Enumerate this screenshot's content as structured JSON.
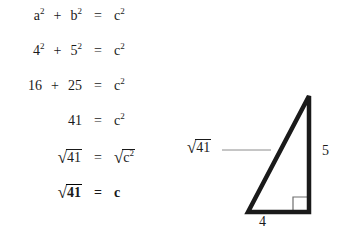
{
  "equations": {
    "rows": [
      {
        "lhs_a": "a",
        "lhs_a_sup": "2",
        "operator": "+",
        "lhs_b": "b",
        "lhs_b_sup": "2",
        "equals": "=",
        "rhs": "c",
        "rhs_sup": "2",
        "bold": false
      },
      {
        "lhs_a": "4",
        "lhs_a_sup": "2",
        "operator": "+",
        "lhs_b": "5",
        "lhs_b_sup": "2",
        "equals": "=",
        "rhs": "c",
        "rhs_sup": "2",
        "bold": false
      },
      {
        "lhs_a": "16",
        "lhs_a_sup": "",
        "operator": "+",
        "lhs_b": "25",
        "lhs_b_sup": "",
        "equals": "=",
        "rhs": "c",
        "rhs_sup": "2",
        "bold": false
      },
      {
        "lhs_a": "",
        "lhs_a_sup": "",
        "operator": "",
        "lhs_b": "41",
        "lhs_b_sup": "",
        "equals": "=",
        "rhs": "c",
        "rhs_sup": "2",
        "bold": false
      },
      {
        "lhs_a": "",
        "lhs_a_sup": "",
        "operator": "",
        "lhs_b_radicand": "41",
        "equals": "=",
        "rhs_radicand": "c",
        "rhs_radicand_sup": "2",
        "bold": false
      },
      {
        "lhs_a": "",
        "lhs_a_sup": "",
        "operator": "",
        "lhs_b_radicand": "41",
        "equals": "=",
        "rhs": "c",
        "rhs_sup": "",
        "bold": true
      }
    ],
    "radical_sign": "√"
  },
  "diagram": {
    "hypotenuse_label_radicand": "41",
    "hypotenuse_radical_sign": "√",
    "vertical_leg_label": "5",
    "horizontal_leg_label": "4",
    "stroke_color": "#1a1a1a",
    "leader_line_color": "#8c8c8c",
    "right_angle_color": "#6e6e6e"
  }
}
